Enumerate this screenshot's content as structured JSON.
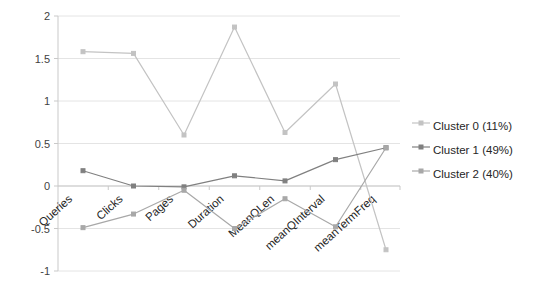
{
  "chart_data": {
    "type": "line",
    "title": "",
    "xlabel": "",
    "ylabel": "",
    "categories": [
      "Queries",
      "Clicks",
      "Pages",
      "Duration",
      "MeanQLen",
      "meanQInterval",
      "meanTermFreq"
    ],
    "ylim": [
      -1,
      2
    ],
    "yticks": [
      2,
      1.5,
      1,
      0.5,
      0,
      -0.5,
      -1
    ],
    "ytick_labels": [
      "2",
      "1.5",
      "1",
      "0.5",
      "0",
      "-0.5",
      "-1"
    ],
    "grid": true,
    "legend_position": "right",
    "series": [
      {
        "name": "Cluster 0 (11%)",
        "color": "#c3c3c3",
        "values": [
          1.58,
          1.56,
          0.6,
          1.87,
          0.63,
          1.2,
          -0.75
        ]
      },
      {
        "name": "Cluster 1 (49%)",
        "color": "#808080",
        "values": [
          0.18,
          0.0,
          -0.01,
          0.12,
          0.06,
          0.31,
          0.45
        ]
      },
      {
        "name": "Cluster 2 (40%)",
        "color": "#a8a8a8",
        "values": [
          -0.49,
          -0.33,
          -0.05,
          -0.5,
          -0.15,
          -0.48,
          0.45
        ]
      }
    ]
  },
  "legend": {
    "items": [
      {
        "label": "Cluster 0 (11%)",
        "color": "#c3c3c3"
      },
      {
        "label": "Cluster 1 (49%)",
        "color": "#808080"
      },
      {
        "label": "Cluster 2 (40%)",
        "color": "#a8a8a8"
      }
    ]
  },
  "axis": {
    "y_tick_labels": [
      "2",
      "1.5",
      "1",
      "0.5",
      "0",
      "-0.5",
      "-1"
    ],
    "x_tick_labels": [
      "Queries",
      "Clicks",
      "Pages",
      "Duration",
      "MeanQLen",
      "meanQInterval",
      "meanTermFreq"
    ]
  },
  "colors": {
    "grid": "#e4e4e4",
    "axis": "#c9c9c9",
    "text": "#262626",
    "background": "#ffffff"
  }
}
